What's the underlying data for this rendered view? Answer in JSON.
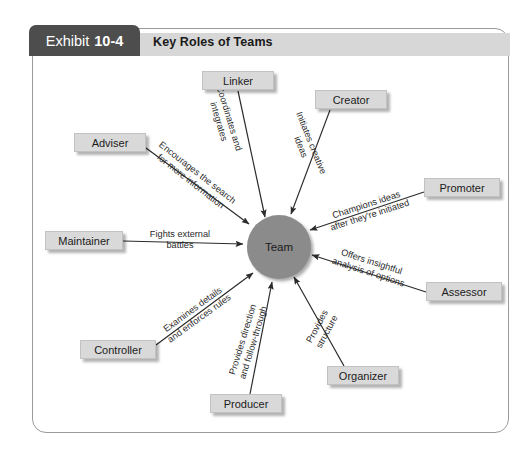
{
  "exhibit": {
    "tab_prefix": "Exhibit",
    "tab_number": "10-4",
    "title": "Key Roles of Teams"
  },
  "center": {
    "label": "Team",
    "color": "#8b8b8b"
  },
  "colors": {
    "tab_background": "#4d4d4d",
    "header_background": "#d7d7d7",
    "node_background": "#d9d9d9",
    "frame_border": "#9a9a9a",
    "line": "#2b2b2b",
    "text": "#1b1b1b",
    "page_background": "#ffffff"
  },
  "roles": [
    {
      "id": "linker",
      "name": "Linker",
      "description": "Coordinates and\nintegrates",
      "box": {
        "x": 202,
        "y": 71,
        "w": 72
      },
      "label": {
        "x": 224,
        "y": 120,
        "rotate": 73
      },
      "line": {
        "x1": 238,
        "y1": 91,
        "x2": 265,
        "y2": 217
      }
    },
    {
      "id": "creator",
      "name": "Creator",
      "description": "Initiates creative\nideas",
      "box": {
        "x": 315,
        "y": 90,
        "w": 72
      },
      "label": {
        "x": 306,
        "y": 145,
        "rotate": 68
      },
      "line": {
        "x1": 330,
        "y1": 110,
        "x2": 291,
        "y2": 214
      }
    },
    {
      "id": "adviser",
      "name": "Adviser",
      "description": "Encourages the search\nfor more information",
      "box": {
        "x": 74,
        "y": 133,
        "w": 72
      },
      "label": {
        "x": 194,
        "y": 177,
        "rotate": 38
      },
      "line": {
        "x1": 146,
        "y1": 148,
        "x2": 249,
        "y2": 224
      }
    },
    {
      "id": "promoter",
      "name": "Promoter",
      "description": "Champions ideas\nafter they're initiated",
      "box": {
        "x": 424,
        "y": 178,
        "w": 76
      },
      "label": {
        "x": 368,
        "y": 210,
        "rotate": -18
      },
      "line": {
        "x1": 424,
        "y1": 192,
        "x2": 310,
        "y2": 230
      }
    },
    {
      "id": "maintainer",
      "name": "Maintainer",
      "description": "Fights external\nbattles",
      "box": {
        "x": 45,
        "y": 231,
        "w": 78
      },
      "label": {
        "x": 180,
        "y": 240,
        "rotate": 0
      },
      "line": {
        "x1": 123,
        "y1": 241,
        "x2": 243,
        "y2": 244
      }
    },
    {
      "id": "assessor",
      "name": "Assessor",
      "description": "Offers insightful\nanalysis of options",
      "box": {
        "x": 426,
        "y": 282,
        "w": 76
      },
      "label": {
        "x": 370,
        "y": 267,
        "rotate": 18
      },
      "line": {
        "x1": 426,
        "y1": 292,
        "x2": 312,
        "y2": 255
      }
    },
    {
      "id": "controller",
      "name": "Controller",
      "description": "Examines details\nand enforces rules",
      "box": {
        "x": 80,
        "y": 340,
        "w": 76
      },
      "label": {
        "x": 196,
        "y": 314,
        "rotate": -36
      },
      "line": {
        "x1": 156,
        "y1": 345,
        "x2": 253,
        "y2": 273
      }
    },
    {
      "id": "producer",
      "name": "Producer",
      "description": "Provides direction\nand follow-through",
      "box": {
        "x": 210,
        "y": 394,
        "w": 72
      },
      "label": {
        "x": 248,
        "y": 341,
        "rotate": -73
      },
      "line": {
        "x1": 250,
        "y1": 394,
        "x2": 272,
        "y2": 282
      }
    },
    {
      "id": "organizer",
      "name": "Organizer",
      "description": "Provides\nstructure",
      "box": {
        "x": 327,
        "y": 366,
        "w": 72
      },
      "label": {
        "x": 322,
        "y": 329,
        "rotate": -62
      },
      "line": {
        "x1": 344,
        "y1": 366,
        "x2": 294,
        "y2": 277
      }
    }
  ]
}
